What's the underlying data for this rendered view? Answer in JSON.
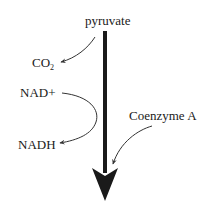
{
  "diagram": {
    "nodes": {
      "start": "pyruvate",
      "co2_main": "CO",
      "co2_sub": "2",
      "nad_in": "NAD+",
      "nadh_out": "NADH",
      "coa_in": "Coenzyme A"
    },
    "colors": {
      "main_arrow": "#1a1a1a",
      "side_arrow": "#333333",
      "text": "#1a1a1a",
      "background": "#ffffff"
    }
  }
}
